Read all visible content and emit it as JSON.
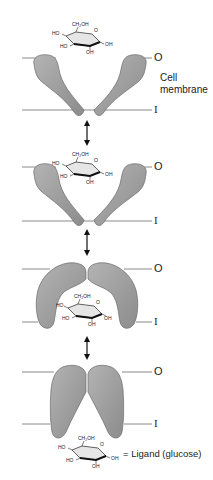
{
  "diagram": {
    "type": "membrane-transporter-conformation-sequence",
    "labels": {
      "outside": "O",
      "inside": "I",
      "cell_membrane": [
        "Cell",
        "membrane"
      ],
      "legend": "= Ligand (glucose)"
    },
    "molecule": {
      "name": "glucose",
      "groups": {
        "ch2oh": "CH₂OH",
        "ring_o": "O",
        "ho_left": "HO",
        "ho_bottom_left": "HO",
        "oh_bottom": "OH",
        "oh_right": "OH"
      }
    },
    "panels": [
      {
        "step": 1,
        "state": "open-outward, ligand outside",
        "membrane_outer_y": 58,
        "membrane_inner_y": 110
      },
      {
        "step": 2,
        "state": "open-outward, ligand bound",
        "membrane_outer_y": 167,
        "membrane_inner_y": 221
      },
      {
        "step": 3,
        "state": "open-inward, ligand bound",
        "membrane_outer_y": 269,
        "membrane_inner_y": 322
      },
      {
        "step": 4,
        "state": "open-inward, ligand released",
        "membrane_outer_y": 372,
        "membrane_inner_y": 424
      }
    ],
    "colors": {
      "protein_fill": "#9c9c9c",
      "protein_stroke": "#6a6a6a",
      "membrane_line": "#8a8a8a",
      "text": "#222222"
    }
  }
}
